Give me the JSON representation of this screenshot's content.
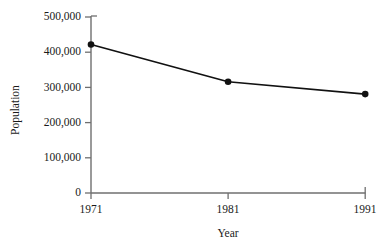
{
  "chart_data": {
    "type": "line",
    "title": "",
    "xlabel": "Year",
    "ylabel": "Population",
    "x": [
      1971,
      1981,
      1991
    ],
    "xtick_labels": [
      "1971",
      "1981",
      "1991"
    ],
    "ytick_labels": [
      "0",
      "100,000",
      "200,000",
      "300,000",
      "400,000",
      "500,000"
    ],
    "ytick_values": [
      0,
      100000,
      200000,
      300000,
      400000,
      500000
    ],
    "ylim": [
      0,
      500000
    ],
    "xlim": [
      1971,
      1991
    ],
    "grid": false,
    "legend": false,
    "legend_position": "none",
    "series": [
      {
        "name": "Population",
        "values": [
          422000,
          316000,
          281000
        ],
        "marker": "filled-circle",
        "line_color": "#111111",
        "marker_color": "#111111"
      }
    ],
    "annotations": []
  },
  "style": {
    "background": "#ffffff",
    "axis_color": "#6f6f6f",
    "text_color": "#1a1a1a",
    "line_color": "#111111",
    "marker_color": "#111111"
  },
  "axes": {
    "x_label_text": "Year",
    "y_label_text": "Population",
    "y_ticks": [
      {
        "label": "500,000",
        "value": 500000
      },
      {
        "label": "400,000",
        "value": 400000
      },
      {
        "label": "300,000",
        "value": 300000
      },
      {
        "label": "200,000",
        "value": 200000
      },
      {
        "label": "100,000",
        "value": 100000
      },
      {
        "label": "0",
        "value": 0
      }
    ],
    "x_ticks": [
      {
        "label": "1971",
        "value": 1971
      },
      {
        "label": "1981",
        "value": 1981
      },
      {
        "label": "1991",
        "value": 1991
      }
    ]
  }
}
